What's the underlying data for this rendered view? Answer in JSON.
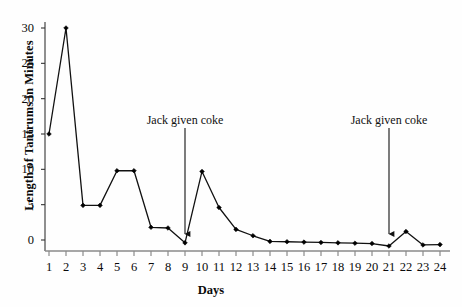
{
  "chart_data": {
    "type": "line",
    "title": "",
    "xlabel": "Days",
    "ylabel": "Length of Tantrums in Minutes",
    "categories": [
      1,
      2,
      3,
      4,
      5,
      6,
      7,
      8,
      9,
      10,
      11,
      12,
      13,
      14,
      15,
      16,
      17,
      18,
      19,
      20,
      21,
      22,
      23,
      24
    ],
    "x": [
      1,
      2,
      3,
      4,
      5,
      6,
      7,
      8,
      9,
      10,
      11,
      12,
      13,
      14,
      15,
      16,
      17,
      18,
      19,
      20,
      21,
      22,
      23,
      24
    ],
    "values": [
      15,
      30,
      4.9,
      4.9,
      9.8,
      9.8,
      1.8,
      1.7,
      -0.4,
      9.7,
      4.6,
      1.5,
      0.6,
      -0.2,
      -0.25,
      -0.3,
      -0.35,
      -0.4,
      -0.45,
      -0.5,
      -0.85,
      1.2,
      -0.7,
      -0.65
    ],
    "series": [
      {
        "name": "Length of tantrums",
        "values": [
          15,
          30,
          4.9,
          4.9,
          9.8,
          9.8,
          1.8,
          1.7,
          -0.4,
          9.7,
          4.6,
          1.5,
          0.6,
          -0.2,
          -0.25,
          -0.3,
          -0.35,
          -0.4,
          -0.45,
          -0.5,
          -0.85,
          1.2,
          -0.7,
          -0.65
        ]
      }
    ],
    "ylim": [
      -1.2,
      31.5
    ],
    "xlim": [
      0.4,
      24.6
    ],
    "yticks": [
      0,
      5,
      10,
      15,
      20,
      25,
      30
    ],
    "ytick_labels": [
      "0",
      "5",
      "10",
      "15",
      "20",
      "25",
      "30"
    ],
    "xtick_labels": [
      "1",
      "2",
      "3",
      "4",
      "5",
      "6",
      "7",
      "8",
      "9",
      "10",
      "11",
      "12",
      "13",
      "14",
      "15",
      "16",
      "17",
      "18",
      "19",
      "20",
      "21",
      "22",
      "23",
      "24"
    ],
    "grid": false,
    "legend": "none",
    "line_color": "#111111",
    "marker": "diamond",
    "marker_color": "#000000",
    "annotations": [
      {
        "text": "Jack given coke",
        "x_day": 9,
        "label_y": 113,
        "arrow_top": 128,
        "arrow_bottom": 240
      },
      {
        "text": "Jack given coke",
        "x_day": 21,
        "label_y": 113,
        "arrow_top": 128,
        "arrow_bottom": 240
      }
    ]
  },
  "axes": {
    "y_axis_name": "y-axis",
    "x_axis_name": "x-axis"
  }
}
